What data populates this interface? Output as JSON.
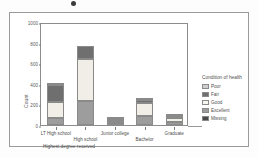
{
  "chart_data": {
    "type": "bar",
    "subtype": "stacked",
    "title": "",
    "xlabel": "Highest degree received",
    "ylabel": "Count",
    "ylim": [
      0,
      1000
    ],
    "yticks": [
      0,
      200,
      400,
      600,
      800,
      1000
    ],
    "ytick_labels": [
      "0",
      "200",
      "400",
      "600",
      "800",
      "1000"
    ],
    "grid": false,
    "legend_position": "right",
    "legend_title": "Condition of health",
    "categories": [
      "LT High school",
      "High school",
      "Junior college",
      "Bachelor",
      "Graduate"
    ],
    "series": [
      {
        "name": "Excellent",
        "color": "#9d9d9d",
        "values": [
          65,
          235,
          22,
          85,
          32
        ]
      },
      {
        "name": "Good",
        "color": "#f0eee6",
        "values": [
          160,
          405,
          20,
          125,
          35
        ]
      },
      {
        "name": "Fair",
        "color": "#6f6f6f",
        "values": [
          165,
          125,
          10,
          35,
          12
        ]
      },
      {
        "name": "Poor",
        "color": "#cfcfcf",
        "values": [
          10,
          0,
          3,
          5,
          1
        ]
      },
      {
        "name": "Missing",
        "color": "#4a4a4a",
        "values": [
          0,
          0,
          0,
          0,
          0
        ]
      }
    ],
    "totals": [
      400,
      765,
      55,
      250,
      80
    ],
    "legend_entries": [
      {
        "label": "Poor",
        "color": "#cfcfcf"
      },
      {
        "label": "Fair",
        "color": "#6f6f6f"
      },
      {
        "label": "Good",
        "color": "#f6f5ef"
      },
      {
        "label": "Excellent",
        "color": "#9d9d9d"
      },
      {
        "label": "Missing",
        "color": "#4a4a4a"
      }
    ]
  },
  "axes": {
    "y_title": "Count",
    "x_title": "Highest degree received"
  }
}
